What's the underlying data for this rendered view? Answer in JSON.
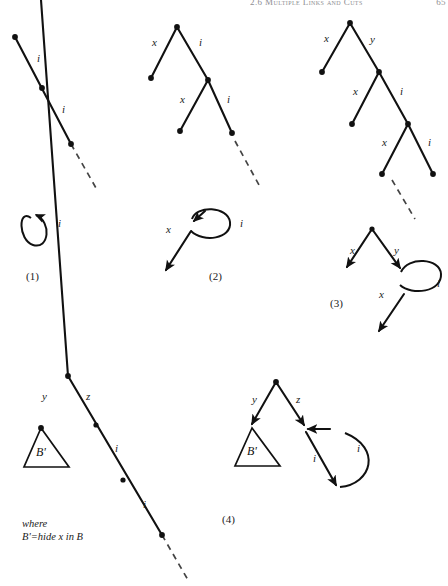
{
  "page": {
    "width": 448,
    "height": 586,
    "background": "#ffffff",
    "ink": "#111111",
    "running_head": "2.6  Multiple Links and Cuts",
    "folio": "65"
  },
  "figure": {
    "caption_1": "(1)",
    "caption_2": "(2)",
    "caption_3": "(3)",
    "caption_4": "(4)",
    "note_line_1": "where",
    "note_line_2": "B'=hide x in B"
  },
  "labels": {
    "i": "i",
    "x": "x",
    "y": "y",
    "z": "z",
    "b_prime": "B'"
  },
  "panel_1": {
    "name": "single-chain-panel",
    "top_edge_labels": [
      "i",
      "i"
    ],
    "bottom_loop_label": "i",
    "caption": "(1)"
  },
  "panel_2": {
    "name": "two-level-tree-panel",
    "top_edge_labels": [
      "x",
      "i",
      "x",
      "i"
    ],
    "bottom_labels": [
      "x",
      "i"
    ],
    "caption": "(2)"
  },
  "panel_3": {
    "name": "three-level-tree-panel",
    "top_edge_labels": [
      "x",
      "y",
      "x",
      "i",
      "x",
      "i"
    ],
    "bottom_labels": [
      "x",
      "y",
      "i",
      "x"
    ],
    "caption": "(3)"
  },
  "panel_4": {
    "name": "hide-rewrite-panel",
    "left_labels": [
      "y",
      "z",
      "B'",
      "i",
      "i"
    ],
    "right_labels": [
      "y",
      "z",
      "B'",
      "i",
      "i"
    ],
    "note": [
      "where",
      "B'=hide x in B"
    ],
    "caption": "(4)"
  }
}
